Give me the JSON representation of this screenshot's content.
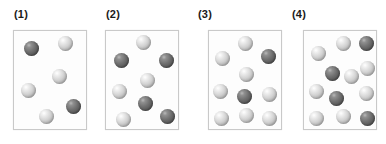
{
  "figure": {
    "title": "",
    "background_color": "#ffffff",
    "panel_count": 4
  },
  "legend": {
    "light_color": "#d2d2d2",
    "dark_color": "#6e6e6e",
    "light_name": "light-sphere",
    "dark_name": "dark-sphere"
  },
  "panels": [
    {
      "label": "(1)",
      "label_x": 14,
      "label_y": 8,
      "box": {
        "x": 13,
        "y": 30,
        "w": 74,
        "h": 100
      },
      "sphere_size": 15,
      "counts": {
        "dark": 2,
        "light": 4,
        "total": 6
      },
      "spheres": [
        {
          "type": "dark",
          "x": 10,
          "y": 10
        },
        {
          "type": "light",
          "x": 44,
          "y": 5
        },
        {
          "type": "light",
          "x": 38,
          "y": 38
        },
        {
          "type": "light",
          "x": 7,
          "y": 52
        },
        {
          "type": "dark",
          "x": 52,
          "y": 68
        },
        {
          "type": "light",
          "x": 25,
          "y": 78
        }
      ]
    },
    {
      "label": "(2)",
      "label_x": 106,
      "label_y": 8,
      "box": {
        "x": 105,
        "y": 30,
        "w": 74,
        "h": 100
      },
      "sphere_size": 15,
      "counts": {
        "dark": 4,
        "light": 4,
        "total": 8
      },
      "spheres": [
        {
          "type": "light",
          "x": 30,
          "y": 4
        },
        {
          "type": "dark",
          "x": 8,
          "y": 22
        },
        {
          "type": "dark",
          "x": 53,
          "y": 22
        },
        {
          "type": "light",
          "x": 34,
          "y": 42
        },
        {
          "type": "light",
          "x": 6,
          "y": 53
        },
        {
          "type": "dark",
          "x": 32,
          "y": 65
        },
        {
          "type": "light",
          "x": 10,
          "y": 81
        },
        {
          "type": "dark",
          "x": 54,
          "y": 78
        }
      ]
    },
    {
      "label": "(3)",
      "label_x": 198,
      "label_y": 8,
      "box": {
        "x": 208,
        "y": 30,
        "w": 74,
        "h": 100
      },
      "sphere_size": 15,
      "counts": {
        "dark": 2,
        "light": 8,
        "total": 10
      },
      "spheres": [
        {
          "type": "light",
          "x": 29,
          "y": 5
        },
        {
          "type": "light",
          "x": 6,
          "y": 20
        },
        {
          "type": "dark",
          "x": 52,
          "y": 18
        },
        {
          "type": "light",
          "x": 30,
          "y": 36
        },
        {
          "type": "light",
          "x": 4,
          "y": 53
        },
        {
          "type": "dark",
          "x": 28,
          "y": 58
        },
        {
          "type": "light",
          "x": 53,
          "y": 56
        },
        {
          "type": "light",
          "x": 5,
          "y": 80
        },
        {
          "type": "light",
          "x": 30,
          "y": 77
        },
        {
          "type": "light",
          "x": 53,
          "y": 80
        }
      ]
    },
    {
      "label": "(4)",
      "label_x": 292,
      "label_y": 8,
      "box": {
        "x": 303,
        "y": 30,
        "w": 74,
        "h": 100
      },
      "sphere_size": 15,
      "counts": {
        "dark": 4,
        "light": 8,
        "total": 12
      },
      "spheres": [
        {
          "type": "light",
          "x": 7,
          "y": 15
        },
        {
          "type": "light",
          "x": 32,
          "y": 5
        },
        {
          "type": "dark",
          "x": 55,
          "y": 5
        },
        {
          "type": "dark",
          "x": 21,
          "y": 35
        },
        {
          "type": "light",
          "x": 40,
          "y": 38
        },
        {
          "type": "light",
          "x": 56,
          "y": 30
        },
        {
          "type": "light",
          "x": 5,
          "y": 53
        },
        {
          "type": "dark",
          "x": 25,
          "y": 60
        },
        {
          "type": "light",
          "x": 55,
          "y": 55
        },
        {
          "type": "light",
          "x": 5,
          "y": 80
        },
        {
          "type": "light",
          "x": 32,
          "y": 78
        },
        {
          "type": "dark",
          "x": 56,
          "y": 80
        }
      ]
    }
  ],
  "chart_data": {
    "type": "scatter",
    "title": "",
    "xlabel": "",
    "ylabel": "",
    "categories": [
      "(1)",
      "(2)",
      "(3)",
      "(4)"
    ],
    "series": [
      {
        "name": "dark spheres",
        "values": [
          2,
          4,
          2,
          4
        ]
      },
      {
        "name": "light spheres",
        "values": [
          4,
          4,
          8,
          8
        ]
      },
      {
        "name": "total spheres",
        "values": [
          6,
          8,
          10,
          12
        ]
      }
    ],
    "legend_position": "none",
    "grid": false
  }
}
